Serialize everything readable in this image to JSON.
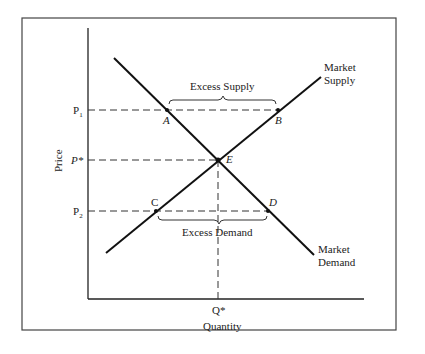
{
  "diagram": {
    "type": "supply-demand",
    "axes": {
      "x_label": "Quantity",
      "y_label": "Price"
    },
    "price_ticks": {
      "p1": "P",
      "p1_sub": "1",
      "pstar": "P*",
      "p2": "P",
      "p2_sub": "2"
    },
    "quantity_tick": "Q*",
    "curves": {
      "supply_line1": "Market",
      "supply_line2": "Supply",
      "demand_line1": "Market",
      "demand_line2": "Demand"
    },
    "points": {
      "a": "A",
      "b": "B",
      "c": "C",
      "d": "D",
      "e": "E"
    },
    "annotations": {
      "excess_supply": "Excess Supply",
      "excess_demand": "Excess Demand"
    }
  }
}
